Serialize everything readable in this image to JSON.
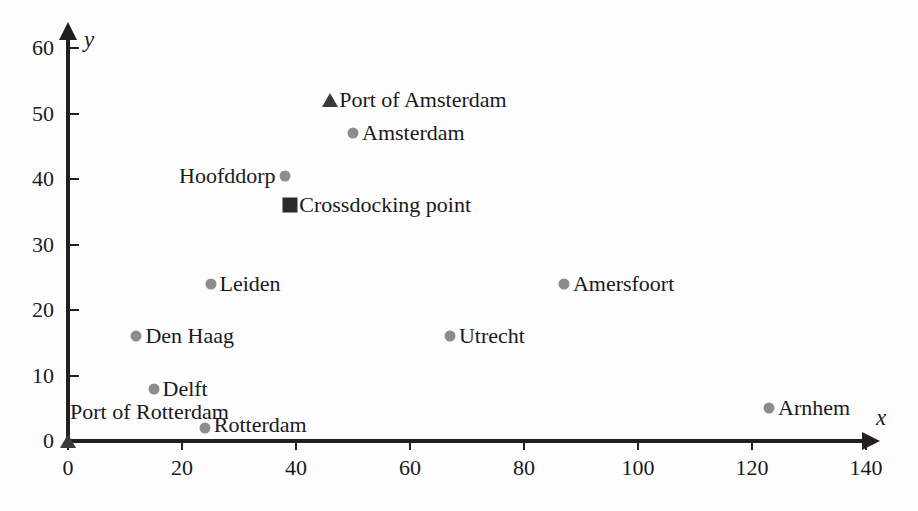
{
  "chart_data": {
    "type": "scatter",
    "title": "",
    "subtitle": "",
    "xlabel": "x",
    "ylabel": "y",
    "xlim": [
      0,
      140
    ],
    "ylim": [
      0,
      60
    ],
    "xticks": [
      0,
      20,
      40,
      60,
      80,
      100,
      120,
      140
    ],
    "yticks": [
      0,
      10,
      20,
      30,
      40,
      50,
      60
    ],
    "xtick_labels": [
      "0",
      "20",
      "40",
      "60",
      "80",
      "100",
      "120",
      "140"
    ],
    "ytick_labels": [
      "0",
      "10",
      "20",
      "30",
      "40",
      "50",
      "60"
    ],
    "grid": false,
    "legend": "none",
    "series": [
      {
        "name": "Cities",
        "marker": "circle",
        "color": "#8c8c8c",
        "points": [
          {
            "label": "Rotterdam",
            "x": 24,
            "y": 2,
            "label_side": "right"
          },
          {
            "label": "Delft",
            "x": 15,
            "y": 8,
            "label_side": "right"
          },
          {
            "label": "Den Haag",
            "x": 12,
            "y": 16,
            "label_side": "right"
          },
          {
            "label": "Leiden",
            "x": 25,
            "y": 24,
            "label_side": "right"
          },
          {
            "label": "Hoofddorp",
            "x": 38,
            "y": 40.5,
            "label_side": "left"
          },
          {
            "label": "Amsterdam",
            "x": 50,
            "y": 47,
            "label_side": "right"
          },
          {
            "label": "Utrecht",
            "x": 67,
            "y": 16,
            "label_side": "right"
          },
          {
            "label": "Amersfoort",
            "x": 87,
            "y": 24,
            "label_side": "right"
          },
          {
            "label": "Arnhem",
            "x": 123,
            "y": 5,
            "label_side": "right"
          }
        ]
      },
      {
        "name": "Ports",
        "marker": "triangle",
        "color": "#3a3a3a",
        "points": [
          {
            "label": "Port of Amsterdam",
            "x": 46,
            "y": 52,
            "label_side": "right"
          },
          {
            "label": "Port of Rotterdam",
            "x": 0,
            "y": 0,
            "label_side": "right"
          }
        ]
      },
      {
        "name": "Crossdocking",
        "marker": "square",
        "color": "#2b2b2b",
        "points": [
          {
            "label": "Crossdocking point",
            "x": 39,
            "y": 36,
            "label_side": "right"
          }
        ]
      }
    ]
  },
  "labels": {
    "port_of_amsterdam": "Port of Amsterdam",
    "amsterdam": "Amsterdam",
    "hoofddorp": "Hoofddorp",
    "crossdocking_point": "Crossdocking point",
    "leiden": "Leiden",
    "amersfoort": "Amersfoort",
    "den_haag": "Den Haag",
    "utrecht": "Utrecht",
    "delft": "Delft",
    "port_of_rotterdam": "Port of Rotterdam",
    "rotterdam": "Rotterdam",
    "arnhem": "Arnhem"
  },
  "axis_names": {
    "x": "x",
    "y": "y"
  },
  "caption": {
    "text": ""
  },
  "colors": {
    "axis": "#231f20",
    "city_marker": "#8c8c8c",
    "port_marker": "#3a3a3a",
    "crossdock_marker": "#2b2b2b",
    "text": "#1a1a1a",
    "background": "#fdfdfd"
  }
}
